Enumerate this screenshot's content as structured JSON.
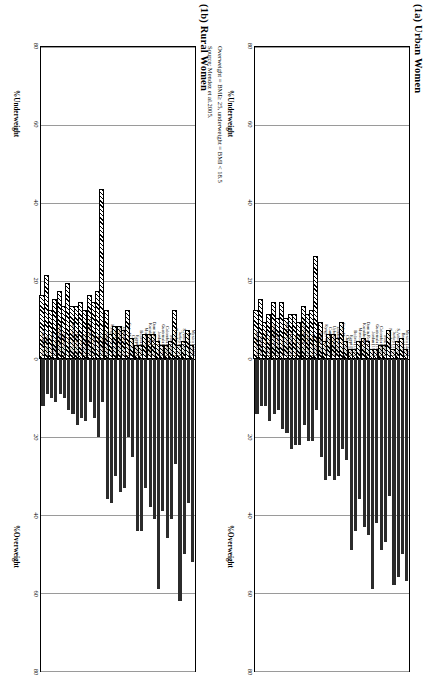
{
  "figure": {
    "panels": [
      {
        "id": "urban",
        "title": "(1a) Urban Women"
      },
      {
        "id": "rural",
        "title": "(1b) Rural Women"
      }
    ],
    "axis_left_label": "%Underweight",
    "axis_right_label": "%Overweight",
    "footnote_line1": "Overweight = BMI≥ 25, underweight = BMI < 18.5",
    "footnote_line2": "Source: Mendez et al.2005."
  },
  "chart_data": {
    "type": "bar",
    "xlabel": "%Underweight  /  %Overweight",
    "ylabel": "",
    "xlim": [
      -80,
      80
    ],
    "xticks": [
      -80,
      -60,
      -40,
      -20,
      0,
      20,
      40,
      60,
      80
    ],
    "xticklabels": [
      "80",
      "60",
      "40",
      "20",
      "0",
      "20",
      "40",
      "60",
      "80"
    ],
    "grid": true,
    "legend": [
      "%Overweight (solid)",
      "%Underweight (hatched)"
    ],
    "categories": [
      "Mexico [4440]",
      "Brazil [4320]",
      "S.Africa [3510]",
      "Turkey [3160]",
      "Namibia [2110]",
      "Peru [2060]",
      "Colombia [2020]",
      "Guatemala [1650]",
      "Jordan [1940]",
      "Domin.Rep. [1570]",
      "Kazakhstan [1290]",
      "Morocco [1100]",
      "Bolivia [1000]",
      "Egypt [990]",
      "China [710]",
      "Cote d'Ivoire [660]",
      "Zimbabwe [630]",
      "Uzbekistan [630]",
      "Cameroon [610]",
      "Kyrgyz Rep [590]",
      "Senegal [590]",
      "India [440]",
      "Ghana [390]",
      "Zambia [360]",
      "C.African Rep. [360]",
      "Kenya [350]",
      "Benin [350]",
      "Nigeria [290]",
      "Burkina Faso [290]",
      "Haiti [270]",
      "Uganda [250]",
      "Madagascar [250]",
      "Mali [240]",
      "Malawi [220]",
      "Niger [200]",
      "Tanzania [190]"
    ],
    "series": [
      {
        "name": "%Overweight",
        "panels": {
          "urban": [
            57,
            50,
            56,
            58,
            35,
            47,
            49,
            42,
            59,
            45,
            43,
            36,
            44,
            49,
            26,
            23,
            30,
            31,
            30,
            31,
            25,
            13,
            21,
            21,
            17,
            22,
            22,
            23,
            19,
            18,
            13,
            14,
            16,
            12,
            12,
            14
          ],
          "rural": [
            52,
            37,
            50,
            62,
            27,
            41,
            46,
            39,
            59,
            41,
            38,
            33,
            44,
            44,
            25,
            20,
            33,
            34,
            30,
            37,
            36,
            11,
            20,
            15,
            11,
            16,
            15,
            17,
            14,
            13,
            10,
            9,
            11,
            10,
            9,
            12
          ]
        }
      },
      {
        "name": "%Underweight",
        "panels": {
          "urban": [
            2,
            5,
            4,
            2,
            7,
            3,
            3,
            2,
            2,
            4,
            5,
            4,
            2,
            2,
            4,
            9,
            5,
            6,
            6,
            4,
            9,
            26,
            12,
            11,
            13,
            9,
            11,
            11,
            10,
            14,
            10,
            14,
            11,
            9,
            15,
            12
          ],
          "rural": [
            3,
            7,
            4,
            3,
            12,
            4,
            3,
            3,
            4,
            6,
            6,
            6,
            3,
            3,
            5,
            12,
            7,
            8,
            8,
            6,
            12,
            43,
            17,
            14,
            16,
            12,
            14,
            13,
            13,
            19,
            13,
            17,
            15,
            12,
            21,
            16
          ]
        }
      }
    ]
  }
}
